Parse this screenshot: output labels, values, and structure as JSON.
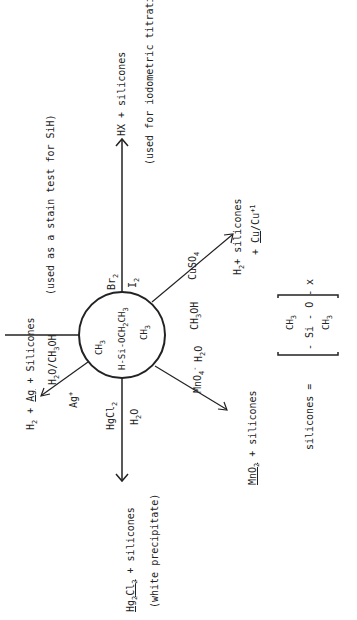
{
  "center_compound": {
    "top_methyl": "CH",
    "top_methyl_sub": "3",
    "main_line": "H-Si-OCH",
    "main_line_sub": "2",
    "main_line_end": "CH",
    "main_line_end_sub": "3",
    "bottom_methyl": "CH",
    "bottom_methyl_sub": "3"
  },
  "reactions": {
    "silver": {
      "reagent": "Ag",
      "reagent_sup": "+",
      "solvent": "H",
      "solvent_sub": "2",
      "solvent_rest": "O/CH",
      "solvent_sub2": "3",
      "solvent_end": "OH",
      "product_h2": "H",
      "product_h2_sub": "2",
      "product_plus": " + ",
      "product_ag": "Ag",
      "product_rest": " + Silicones",
      "note": "(used as a stain test for SiH)"
    },
    "halogen": {
      "reagent1": "Br",
      "reagent1_sub": "2",
      "reagent2": "I",
      "reagent2_sub": "2",
      "product": "HX + silicones",
      "note": "(used for iodometric titration)"
    },
    "copper": {
      "reagent": "CuSO",
      "reagent_sub": "4",
      "solvent": "CH",
      "solvent_sub": "3",
      "solvent_end": "OH",
      "product_h2": "H",
      "product_h2_sub": "2",
      "product_rest": "+ silicones",
      "product2_plus": "+ ",
      "product2_cu": "Cu",
      "product2_rest": "/Cu",
      "product2_sup": "+1"
    },
    "permanganate": {
      "reagent": "MnO",
      "reagent_sub": "4",
      "reagent_sup": "-",
      "solvent": "H",
      "solvent_sub": "2",
      "solvent_end": "O",
      "product_mno2": "MnO",
      "product_mno2_sub": "2",
      "product_rest": " + silicones"
    },
    "mercury": {
      "reagent": "HgCl",
      "reagent_sub": "2",
      "solvent": "H",
      "solvent_sub": "2",
      "solvent_end": "O",
      "product_hg": "Hg",
      "product_hg_sub": "2",
      "product_cl": "Cl",
      "product_cl_sub": "2",
      "product_rest": " + silicones",
      "note": "(white precipitate)"
    }
  },
  "silicones_definition": {
    "label": "silicones =",
    "top_group": "CH",
    "top_group_sub": "3",
    "chain": "- Si - O -",
    "bottom_group": "CH",
    "bottom_group_sub": "3",
    "repeat": "x"
  }
}
